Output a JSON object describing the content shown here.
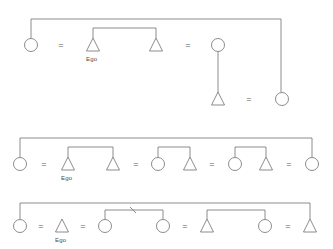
{
  "figure": {
    "stroke_color": "#6f6f6f",
    "label_color": "#4a4a4a",
    "background_color": "#ffffff",
    "symbol_legend": {
      "circle": "female",
      "triangle": "male",
      "equals": "marriage-tie",
      "vertical-line": "descent-line",
      "bracket": "sibling-tie"
    }
  },
  "diagrams": [
    {
      "id": "diagram-1",
      "name": "kinship-diagram-1",
      "nodes": [
        {
          "id": "d1n1",
          "shape": "circle",
          "sex": "female",
          "x": 31,
          "y": 45,
          "label": ""
        },
        {
          "id": "d1n2",
          "shape": "triangle",
          "sex": "male",
          "x": 93,
          "y": 45,
          "label": "Ego"
        },
        {
          "id": "d1n3",
          "shape": "triangle",
          "sex": "male",
          "x": 156,
          "y": 45,
          "label": ""
        },
        {
          "id": "d1n4",
          "shape": "circle",
          "sex": "female",
          "x": 218,
          "y": 45,
          "label": ""
        },
        {
          "id": "d1n5",
          "shape": "triangle",
          "sex": "male",
          "x": 218,
          "y": 99,
          "label": ""
        },
        {
          "id": "d1n6",
          "shape": "circle",
          "sex": "female",
          "x": 282,
          "y": 99,
          "label": ""
        }
      ],
      "marriages": [
        {
          "x": 61,
          "y": 45
        },
        {
          "x": 188,
          "y": 45
        },
        {
          "x": 249,
          "y": 99
        }
      ],
      "labels": [
        {
          "text": "Ego",
          "x": 93,
          "y": 59
        }
      ]
    },
    {
      "id": "diagram-2",
      "name": "kinship-diagram-2",
      "nodes": [
        {
          "id": "d2n1",
          "shape": "circle",
          "sex": "female",
          "x": 20,
          "y": 164,
          "label": ""
        },
        {
          "id": "d2n2",
          "shape": "triangle",
          "sex": "male",
          "x": 68,
          "y": 164,
          "label": "Ego"
        },
        {
          "id": "d2n3",
          "shape": "triangle",
          "sex": "male",
          "x": 113,
          "y": 164,
          "label": ""
        },
        {
          "id": "d2n4",
          "shape": "circle",
          "sex": "female",
          "x": 158,
          "y": 164,
          "label": ""
        },
        {
          "id": "d2n5",
          "shape": "triangle",
          "sex": "male",
          "x": 190,
          "y": 164,
          "label": ""
        },
        {
          "id": "d2n6",
          "shape": "circle",
          "sex": "female",
          "x": 235,
          "y": 164,
          "label": ""
        },
        {
          "id": "d2n7",
          "shape": "triangle",
          "sex": "male",
          "x": 266,
          "y": 164,
          "label": ""
        },
        {
          "id": "d2n8",
          "shape": "circle",
          "sex": "female",
          "x": 312,
          "y": 164,
          "label": ""
        }
      ],
      "marriages": [
        {
          "x": 44,
          "y": 164
        },
        {
          "x": 136,
          "y": 164
        },
        {
          "x": 212,
          "y": 164
        },
        {
          "x": 289,
          "y": 164
        }
      ],
      "labels": [
        {
          "text": "Ego",
          "x": 68,
          "y": 178
        }
      ]
    },
    {
      "id": "diagram-3",
      "name": "kinship-diagram-3",
      "nodes": [
        {
          "id": "d3n1",
          "shape": "circle",
          "sex": "female",
          "x": 20,
          "y": 226,
          "label": ""
        },
        {
          "id": "d3n2",
          "shape": "triangle",
          "sex": "male",
          "x": 62,
          "y": 226,
          "label": "Ego"
        },
        {
          "id": "d3n3",
          "shape": "circle",
          "sex": "female",
          "x": 105,
          "y": 226,
          "label": ""
        },
        {
          "id": "d3n4",
          "shape": "circle",
          "sex": "female",
          "x": 163,
          "y": 226,
          "label": ""
        },
        {
          "id": "d3n5",
          "shape": "triangle",
          "sex": "male",
          "x": 207,
          "y": 226,
          "label": ""
        },
        {
          "id": "d3n6",
          "shape": "circle",
          "sex": "female",
          "x": 265,
          "y": 226,
          "label": ""
        },
        {
          "id": "d3n7",
          "shape": "triangle",
          "sex": "male",
          "x": 310,
          "y": 226,
          "label": ""
        }
      ],
      "marriages": [
        {
          "x": 41,
          "y": 226
        },
        {
          "x": 83,
          "y": 226
        },
        {
          "x": 185,
          "y": 226
        },
        {
          "x": 288,
          "y": 226
        }
      ],
      "labels": [
        {
          "text": "Ego",
          "x": 62,
          "y": 240
        }
      ]
    }
  ],
  "marriage_symbol": "=",
  "ego_label": "Ego"
}
